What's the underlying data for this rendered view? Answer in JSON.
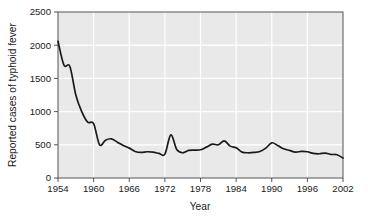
{
  "chart_data": {
    "type": "line",
    "title": "",
    "xlabel": "Year",
    "ylabel": "Reported cases of typhoid fever",
    "xlim": [
      1954,
      2002
    ],
    "ylim": [
      0,
      2500
    ],
    "xticks": [
      1954,
      1960,
      1966,
      1972,
      1978,
      1984,
      1990,
      1996,
      2002
    ],
    "yticks": [
      0,
      500,
      1000,
      1500,
      2000,
      2500
    ],
    "xtick_labels": [
      "1954",
      "1960",
      "1966",
      "1972",
      "1978",
      "1984",
      "1990",
      "1996",
      "2002"
    ],
    "ytick_labels": [
      "0",
      "500",
      "1000",
      "1500",
      "2000",
      "2500"
    ],
    "grid": true,
    "legend": null,
    "series": [
      {
        "name": "Reported cases of typhoid fever",
        "color": "#1a1a1a",
        "x": [
          1954,
          1955,
          1956,
          1957,
          1958,
          1959,
          1960,
          1961,
          1962,
          1963,
          1964,
          1965,
          1966,
          1967,
          1968,
          1969,
          1970,
          1971,
          1972,
          1973,
          1974,
          1975,
          1976,
          1977,
          1978,
          1979,
          1980,
          1981,
          1982,
          1983,
          1984,
          1985,
          1986,
          1987,
          1988,
          1989,
          1990,
          1991,
          1992,
          1993,
          1994,
          1995,
          1996,
          1997,
          1998,
          1999,
          2000,
          2001,
          2002
        ],
        "values": [
          2060,
          1700,
          1680,
          1250,
          1000,
          840,
          820,
          500,
          570,
          590,
          540,
          490,
          450,
          400,
          385,
          395,
          390,
          370,
          360,
          650,
          430,
          380,
          415,
          420,
          425,
          465,
          510,
          500,
          560,
          480,
          455,
          390,
          380,
          385,
          400,
          450,
          530,
          490,
          440,
          415,
          390,
          400,
          395,
          370,
          365,
          375,
          355,
          350,
          300
        ]
      }
    ]
  },
  "axis": {
    "ylabel": "Reported cases of typhoid fever",
    "xlabel": "Year"
  }
}
